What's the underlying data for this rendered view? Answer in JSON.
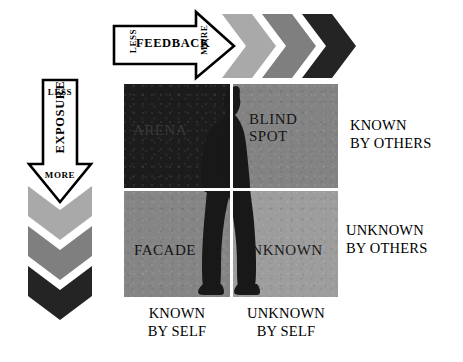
{
  "diagram": {
    "quadrants": [
      {
        "key": "arena",
        "label": "ARENA",
        "fill": "#1c1c1c",
        "text_color": "#3a3a3a"
      },
      {
        "key": "blind",
        "label": "BLIND\nSPOT",
        "fill": "#838383",
        "text_color": "#151515"
      },
      {
        "key": "facade",
        "label": "FACADE",
        "fill": "#858585",
        "text_color": "#141414"
      },
      {
        "key": "unknown",
        "label": "UNKNOWN",
        "fill": "#9d9d9d",
        "text_color": "#1a1a1a"
      }
    ],
    "row_labels": [
      {
        "key": "known-by-others",
        "label": "KNOWN\nBY OTHERS"
      },
      {
        "key": "unknown-by-others",
        "label": "UNKNOWN\nBY OTHERS"
      }
    ],
    "column_labels": [
      {
        "key": "known-by-self",
        "label": "KNOWN\nBY SELF"
      },
      {
        "key": "unknown-by-self",
        "label": "UNKNOWN\nBY SELF"
      }
    ],
    "feedback_axis": {
      "name": "FEEDBACK",
      "low": "LESS",
      "high": "MORE",
      "direction": "right",
      "chevron_colors": [
        "#a9a9a9",
        "#7f7f7f",
        "#242424"
      ]
    },
    "exposure_axis": {
      "name": "EXPOSURE",
      "low": "LESS",
      "high": "MORE",
      "direction": "down",
      "chevron_colors": [
        "#a9a9a9",
        "#7f7f7f",
        "#242424"
      ]
    },
    "colors": {
      "background": "#ffffff",
      "outline": "#000000",
      "divider": "#fdfdfd",
      "silhouette": "#181818"
    },
    "icons": {
      "silhouette": "person-silhouette-icon",
      "feedback_arrow": "arrow-right-icon",
      "exposure_arrow": "arrow-down-icon"
    }
  }
}
